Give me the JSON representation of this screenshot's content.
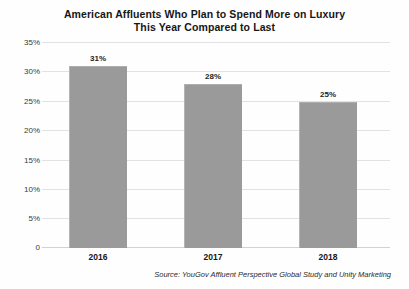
{
  "chart_data": {
    "type": "bar",
    "title": "American Affluents Who Plan to Spend More on Luxury This Year Compared to Last",
    "title_lines": [
      "American Affluents Who Plan to Spend More on Luxury",
      "This Year Compared to Last"
    ],
    "categories": [
      "2016",
      "2017",
      "2018"
    ],
    "values": [
      31,
      28,
      25
    ],
    "value_labels": [
      "31%",
      "28%",
      "25%"
    ],
    "xlabel": "",
    "ylabel": "",
    "ylim": [
      0,
      35
    ],
    "yticks": [
      35,
      30,
      25,
      20,
      15,
      10,
      5,
      0
    ],
    "ytick_labels": [
      "35%",
      "30%",
      "25%",
      "20%",
      "15%",
      "10%",
      "5%",
      "0"
    ],
    "grid": true,
    "legend": false,
    "bar_color": "#9a9a9a",
    "gridline_color": "#e2e2e2",
    "background_color": "#fefefe",
    "source_note": "Source: YouGov Affluent Perspective Global Study and Unity Marketing"
  }
}
